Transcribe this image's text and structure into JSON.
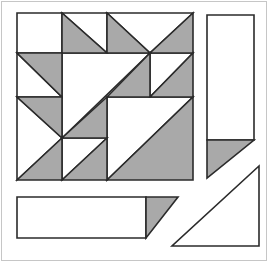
{
  "figure": {
    "canvas": {
      "width": 268,
      "height": 262,
      "background": "#ffffff",
      "frame_color": "#c6c6c6"
    },
    "palette": {
      "gray": "#a9a9a9",
      "white": "#ffffff",
      "outline": "#2b2b2b",
      "stroke_width": 1.6
    },
    "main_block": {
      "left": 17,
      "top": 13,
      "right": 193,
      "bottom": 180,
      "grid_x": [
        62,
        107,
        150
      ],
      "grid_y": [
        53,
        97,
        138
      ]
    },
    "pieces": [
      {
        "name": "white-square-row1-col1",
        "fill": "white",
        "points": [
          [
            17,
            13
          ],
          [
            62,
            13
          ],
          [
            62,
            53
          ],
          [
            17,
            53
          ]
        ]
      },
      {
        "name": "white-triangle-row1-col2",
        "fill": "white",
        "points": [
          [
            62,
            13
          ],
          [
            107,
            13
          ],
          [
            107,
            53
          ]
        ]
      },
      {
        "name": "white-valley-triangle-row1",
        "fill": "white",
        "points": [
          [
            107,
            13
          ],
          [
            193,
            13
          ],
          [
            150,
            53
          ]
        ]
      },
      {
        "name": "white-triangle-row2-col1",
        "fill": "white",
        "points": [
          [
            17,
            53
          ],
          [
            17,
            97
          ],
          [
            62,
            97
          ]
        ]
      },
      {
        "name": "white-left-point-triangle",
        "fill": "white",
        "points": [
          [
            17,
            97
          ],
          [
            62,
            138
          ],
          [
            17,
            180
          ]
        ]
      },
      {
        "name": "white-central-large-triangle",
        "fill": "white",
        "points": [
          [
            62,
            53
          ],
          [
            150,
            53
          ],
          [
            62,
            138
          ]
        ]
      },
      {
        "name": "white-triangle-row2-col4",
        "fill": "white",
        "points": [
          [
            150,
            53
          ],
          [
            193,
            53
          ],
          [
            150,
            97
          ]
        ]
      },
      {
        "name": "white-large-triangle-bottom-right-block",
        "fill": "white",
        "points": [
          [
            107,
            97
          ],
          [
            193,
            97
          ],
          [
            107,
            180
          ]
        ]
      },
      {
        "name": "white-triangle-row4-col2",
        "fill": "white",
        "points": [
          [
            62,
            138
          ],
          [
            107,
            138
          ],
          [
            62,
            180
          ]
        ]
      },
      {
        "name": "gray-triangle-row1-col2",
        "fill": "gray",
        "points": [
          [
            62,
            13
          ],
          [
            62,
            53
          ],
          [
            107,
            53
          ]
        ]
      },
      {
        "name": "gray-triangle-row1-col3",
        "fill": "gray",
        "points": [
          [
            107,
            13
          ],
          [
            107,
            53
          ],
          [
            150,
            53
          ]
        ]
      },
      {
        "name": "gray-triangle-row1-col4",
        "fill": "gray",
        "points": [
          [
            150,
            53
          ],
          [
            193,
            53
          ],
          [
            193,
            13
          ]
        ]
      },
      {
        "name": "gray-triangle-row2-col1",
        "fill": "gray",
        "points": [
          [
            17,
            53
          ],
          [
            62,
            53
          ],
          [
            62,
            97
          ]
        ]
      },
      {
        "name": "gray-triangle-row3-col1",
        "fill": "gray",
        "points": [
          [
            17,
            97
          ],
          [
            62,
            97
          ],
          [
            62,
            138
          ]
        ]
      },
      {
        "name": "gray-triangle-row2-col3",
        "fill": "gray",
        "points": [
          [
            107,
            97
          ],
          [
            150,
            53
          ],
          [
            150,
            97
          ]
        ]
      },
      {
        "name": "gray-triangle-row3-col2",
        "fill": "gray",
        "points": [
          [
            62,
            138
          ],
          [
            107,
            97
          ],
          [
            107,
            138
          ]
        ]
      },
      {
        "name": "gray-triangle-row2-col4",
        "fill": "gray",
        "points": [
          [
            150,
            97
          ],
          [
            193,
            53
          ],
          [
            193,
            97
          ]
        ]
      },
      {
        "name": "gray-large-triangle-bottom-right-block",
        "fill": "gray",
        "points": [
          [
            107,
            180
          ],
          [
            193,
            97
          ],
          [
            193,
            180
          ]
        ]
      },
      {
        "name": "gray-triangle-row4-col1",
        "fill": "gray",
        "points": [
          [
            17,
            180
          ],
          [
            62,
            138
          ],
          [
            62,
            180
          ]
        ]
      },
      {
        "name": "gray-triangle-row4-col2",
        "fill": "gray",
        "points": [
          [
            62,
            180
          ],
          [
            107,
            138
          ],
          [
            107,
            180
          ]
        ]
      },
      {
        "name": "right-rectangle-white-body",
        "fill": "white",
        "points": [
          [
            207,
            15
          ],
          [
            254,
            15
          ],
          [
            254,
            140
          ],
          [
            207,
            140
          ]
        ]
      },
      {
        "name": "right-rectangle-gray-tip",
        "fill": "gray",
        "points": [
          [
            207,
            140
          ],
          [
            254,
            140
          ],
          [
            207,
            178
          ]
        ]
      },
      {
        "name": "bottom-rectangle-white-body",
        "fill": "white",
        "points": [
          [
            17,
            197
          ],
          [
            146,
            197
          ],
          [
            146,
            238
          ],
          [
            17,
            238
          ]
        ]
      },
      {
        "name": "bottom-rectangle-gray-tip",
        "fill": "gray",
        "points": [
          [
            146,
            197
          ],
          [
            178,
            197
          ],
          [
            146,
            238
          ]
        ]
      },
      {
        "name": "white-corner-triangle-bottom-right",
        "fill": "white",
        "points": [
          [
            172,
            246
          ],
          [
            259,
            246
          ],
          [
            259,
            166
          ]
        ]
      }
    ]
  }
}
